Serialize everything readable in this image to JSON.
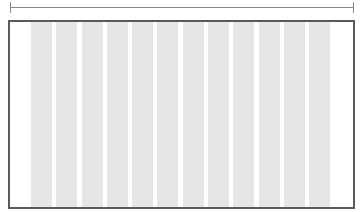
{
  "diagram": {
    "type": "column-grid-layout",
    "columns": 12,
    "colors": {
      "column_fill": "#e6e6e6",
      "frame_border": "#5a5a5a",
      "measure_line": "#8a8a8a",
      "background": "#ffffff"
    }
  }
}
